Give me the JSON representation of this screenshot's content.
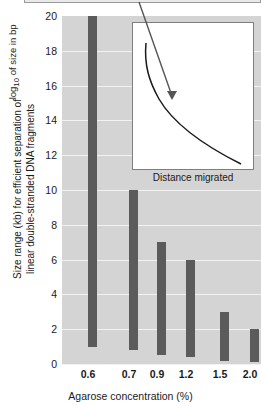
{
  "chart_data": {
    "type": "bar",
    "title": "",
    "xlabel": "Agarose concentration (%)",
    "ylabel": "Size range (kb) for efficient separation of\nlinear double-stranded DNA fragments",
    "categories": [
      "0.6",
      "0.7",
      "0.9",
      "1.2",
      "1.5",
      "2.0"
    ],
    "yticks": [
      "0",
      "2",
      "4",
      "6",
      "8",
      "10",
      "12",
      "14",
      "16",
      "18",
      "20"
    ],
    "ylim": [
      0,
      20
    ],
    "grid": true,
    "legend": "none",
    "bar_style": "floating-range",
    "series": [
      {
        "name": "Size range (kb)",
        "ranges": [
          {
            "category": "0.6",
            "low": 1.0,
            "high": 20.0
          },
          {
            "category": "0.7",
            "low": 0.8,
            "high": 10.0
          },
          {
            "category": "0.9",
            "low": 0.5,
            "high": 7.0
          },
          {
            "category": "1.2",
            "low": 0.4,
            "high": 6.0
          },
          {
            "category": "1.5",
            "low": 0.2,
            "high": 3.0
          },
          {
            "category": "2.0",
            "low": 0.1,
            "high": 2.0
          }
        ]
      }
    ],
    "colors": {
      "bar": "#5b5b5b",
      "plot_background": "#d4d4d4",
      "gridline": "#f2f2f2",
      "inset_background": "#ffffff",
      "inset_border": "#7e7e7e",
      "text": "#1a1a1a"
    }
  },
  "inset": {
    "type": "line",
    "xlabel": "Distance migrated",
    "ylabel_prefix": "log",
    "ylabel_sub": "10",
    "ylabel_suffix": " of size in bp",
    "ylabel_full": "log10 of size in bp",
    "description": "decreasing concave curve of log size versus distance migrated",
    "annotation_arrow": "pointer from above into the curve"
  }
}
